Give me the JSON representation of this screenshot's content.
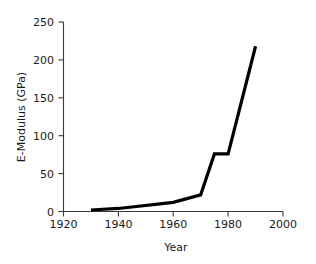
{
  "chart_data": {
    "type": "line",
    "title": "",
    "xlabel": "Year",
    "ylabel": "E-Modulus (GPa)",
    "xlim": [
      1920,
      2000
    ],
    "ylim": [
      0,
      250
    ],
    "xticks": [
      1920,
      1940,
      1960,
      1980,
      2000
    ],
    "yticks": [
      0,
      50,
      100,
      150,
      200,
      250
    ],
    "xtick_labels": [
      "1920",
      "1940",
      "1960",
      "1980",
      "2000"
    ],
    "ytick_labels": [
      "0",
      "50",
      "100",
      "150",
      "200",
      "250"
    ],
    "grid": false,
    "legend": null,
    "series": [
      {
        "name": "E-Modulus",
        "color": "#000000",
        "x": [
          1930,
          1940,
          1960,
          1970,
          1975,
          1980,
          1990
        ],
        "y": [
          2,
          4,
          12,
          22,
          76,
          76,
          218
        ]
      }
    ]
  },
  "axes": {
    "x_axis_name": "Year",
    "y_axis_name": "E-Modulus (GPa)"
  }
}
